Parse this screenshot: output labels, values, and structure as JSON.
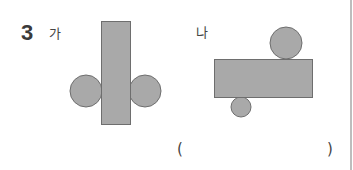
{
  "question": {
    "number": "3",
    "figures": [
      {
        "label": "가",
        "description": "tall rectangle with two circles on left and right sides"
      },
      {
        "label": "나",
        "description": "wide rectangle with circle above right and small circle below left"
      }
    ],
    "answer": {
      "open_paren": "(",
      "close_paren": ")",
      "value": ""
    }
  },
  "colors": {
    "shape_fill": "#a9a9a9",
    "shape_stroke": "#6e6e6e",
    "divider": "#bdbdbd"
  }
}
